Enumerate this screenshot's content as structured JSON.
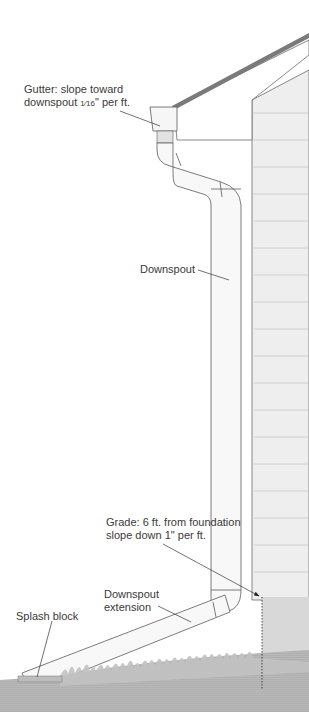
{
  "diagram": {
    "colors": {
      "background": "#ffffff",
      "line": "#5a5a5a",
      "roof_edge": "#7a7a7a",
      "siding": "#ececec",
      "siding_line": "#c8c8c8",
      "foundation": "#d6d6d6",
      "ground": "#b4b4b4",
      "grass": "#c4c4c4",
      "text": "#3a3a3a"
    },
    "labels": {
      "gutter": {
        "line1": "Gutter: slope toward",
        "line2_prefix": "downspout ",
        "line2_fraction": "1⁄16",
        "line2_suffix": "\" per ft."
      },
      "downspout": {
        "text": "Downspout"
      },
      "grade": {
        "line1": "Grade: 6 ft. from foundation",
        "line2": "slope down 1\" per ft."
      },
      "extension": {
        "line1": "Downspout",
        "line2": "extension"
      },
      "splash_block": {
        "text": "Splash block"
      }
    }
  }
}
